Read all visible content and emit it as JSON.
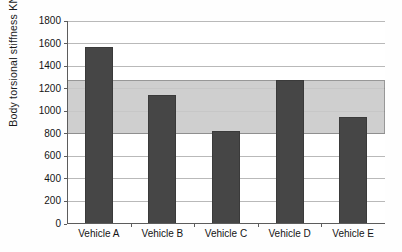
{
  "chart_data": {
    "type": "bar",
    "title": "",
    "xlabel": "",
    "ylabel": "Body torsional stiffness KN-m rad",
    "ylabel_superscript": "−1",
    "ylabel_full": "Body torsional stiffness KN-m rad⁻¹",
    "categories": [
      "Vehicle A",
      "Vehicle B",
      "Vehicle C",
      "Vehicle D",
      "Vehicle E"
    ],
    "values": [
      1570,
      1145,
      825,
      1275,
      950
    ],
    "series": [
      {
        "name": "Body torsional stiffness",
        "values": [
          1570,
          1145,
          825,
          1275,
          950
        ]
      }
    ],
    "ylim": [
      0,
      1800
    ],
    "yticks": [
      0,
      200,
      400,
      600,
      800,
      1000,
      1200,
      1400,
      1600,
      1800
    ],
    "ytick_labels": [
      "0",
      "200",
      "400",
      "600",
      "800",
      "1000",
      "1200",
      "1400",
      "1600",
      "1800"
    ],
    "grid": "horizontal",
    "legend": "none",
    "bar_color": "#464646",
    "gridline_color": "#b9b9b9",
    "axis_color": "#5c5c5c",
    "annotations": [
      {
        "name": "target-stiffness-band",
        "type": "horizontal-band",
        "y_from": 800,
        "y_to": 1280,
        "color": "#c9c9c9",
        "border_color": "#8a8a8a"
      }
    ]
  }
}
